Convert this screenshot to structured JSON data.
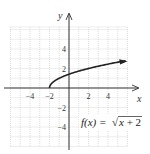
{
  "chart_data": {
    "type": "line",
    "title": "",
    "function_label": "f(x) = √x + 2",
    "function_label_parts": {
      "lhs": "f(x) = ",
      "radical": "√",
      "radicand": "x + 2"
    },
    "xlabel": "x",
    "ylabel": "y",
    "xlim": [
      -6,
      6
    ],
    "ylim": [
      -6,
      6
    ],
    "grid": true,
    "x_ticks": [
      -4,
      -2,
      2,
      4
    ],
    "y_ticks": [
      4,
      2,
      -2,
      -4
    ],
    "x_tick_labels": [
      "−4",
      "−2",
      "2",
      "4"
    ],
    "y_tick_labels": [
      "4",
      "2",
      "−2",
      "−4"
    ],
    "series": [
      {
        "name": "f(x) = sqrt(x + 2)",
        "x": [
          -2,
          -1.5,
          -1,
          0,
          1,
          2,
          3,
          4,
          5,
          5.8
        ],
        "y": [
          0,
          0.71,
          1,
          1.41,
          1.73,
          2,
          2.24,
          2.45,
          2.65,
          2.79
        ],
        "end_arrow": true
      }
    ],
    "colors": {
      "curve": "#222222",
      "grid": "#c8c8c8",
      "axis": "#333333"
    }
  }
}
